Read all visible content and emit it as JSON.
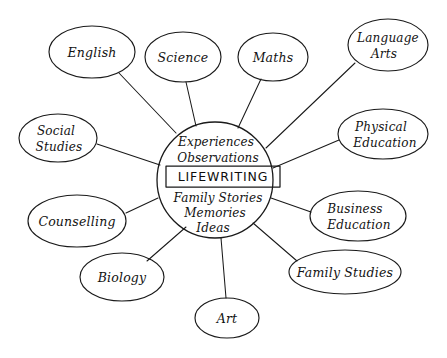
{
  "diagram": {
    "style": "hand-drawn",
    "background_color": "#ffffff",
    "ink_color": "#1a1a1a",
    "canvas": {
      "width": 447,
      "height": 358
    },
    "hub": {
      "name": "lifewriting-hub",
      "core_label": "LIFEWRITING",
      "center": {
        "x": 215,
        "y": 180
      },
      "radius": 58,
      "lines_above": [
        "Experiences",
        "Observations"
      ],
      "lines_below": [
        "Family Stories",
        "Memories",
        "Ideas"
      ]
    },
    "nodes": [
      {
        "id": "english",
        "label": "English",
        "lines": [
          "English"
        ],
        "cx": 92,
        "cy": 52,
        "rx": 43,
        "ry": 26
      },
      {
        "id": "science",
        "label": "Science",
        "lines": [
          "Science"
        ],
        "cx": 183,
        "cy": 57,
        "rx": 38,
        "ry": 25
      },
      {
        "id": "maths",
        "label": "Maths",
        "lines": [
          "Maths"
        ],
        "cx": 273,
        "cy": 57,
        "rx": 35,
        "ry": 24
      },
      {
        "id": "language-arts",
        "label": "Language Arts",
        "lines": [
          "Language",
          "Arts"
        ],
        "cx": 388,
        "cy": 45,
        "rx": 40,
        "ry": 26
      },
      {
        "id": "physical-education",
        "label": "Physical Education",
        "lines": [
          "Physical",
          "Education"
        ],
        "cx": 383,
        "cy": 134,
        "rx": 45,
        "ry": 25
      },
      {
        "id": "business-education",
        "label": "Business Education",
        "lines": [
          "Business",
          "Education"
        ],
        "cx": 358,
        "cy": 216,
        "rx": 48,
        "ry": 25
      },
      {
        "id": "family-studies",
        "label": "Family Studies",
        "lines": [
          "Family Studies"
        ],
        "cx": 345,
        "cy": 272,
        "rx": 56,
        "ry": 22
      },
      {
        "id": "art",
        "label": "Art",
        "lines": [
          "Art"
        ],
        "cx": 227,
        "cy": 318,
        "rx": 32,
        "ry": 20
      },
      {
        "id": "biology",
        "label": "Biology",
        "lines": [
          "Biology"
        ],
        "cx": 122,
        "cy": 277,
        "rx": 42,
        "ry": 24
      },
      {
        "id": "counselling",
        "label": "Counselling",
        "lines": [
          "Counselling"
        ],
        "cx": 77,
        "cy": 221,
        "rx": 49,
        "ry": 26
      },
      {
        "id": "social-studies",
        "label": "Social Studies",
        "lines": [
          "Social",
          "Studies"
        ],
        "cx": 58,
        "cy": 138,
        "rx": 39,
        "ry": 24
      },
      {
        "id": "language-arts-dup",
        "label": "",
        "lines": [],
        "cx": 0,
        "cy": 0,
        "rx": 0,
        "ry": 0
      }
    ],
    "connectors": [
      {
        "from": "english",
        "x1": 119,
        "y1": 73,
        "x2": 176,
        "y2": 133
      },
      {
        "from": "science",
        "x1": 186,
        "y1": 82,
        "x2": 196,
        "y2": 126
      },
      {
        "from": "maths",
        "x1": 261,
        "y1": 79,
        "x2": 238,
        "y2": 128
      },
      {
        "from": "language-arts",
        "x1": 355,
        "y1": 63,
        "x2": 266,
        "y2": 148
      },
      {
        "from": "physical-education",
        "x1": 339,
        "y1": 140,
        "x2": 273,
        "y2": 168
      },
      {
        "from": "business-education",
        "x1": 311,
        "y1": 212,
        "x2": 271,
        "y2": 198
      },
      {
        "from": "family-studies",
        "x1": 297,
        "y1": 261,
        "x2": 253,
        "y2": 223
      },
      {
        "from": "art",
        "x1": 226,
        "y1": 298,
        "x2": 221,
        "y2": 238
      },
      {
        "from": "biology",
        "x1": 147,
        "y1": 261,
        "x2": 186,
        "y2": 227
      },
      {
        "from": "counselling",
        "x1": 126,
        "y1": 213,
        "x2": 158,
        "y2": 198
      },
      {
        "from": "social-studies",
        "x1": 97,
        "y1": 144,
        "x2": 160,
        "y2": 165
      }
    ]
  }
}
